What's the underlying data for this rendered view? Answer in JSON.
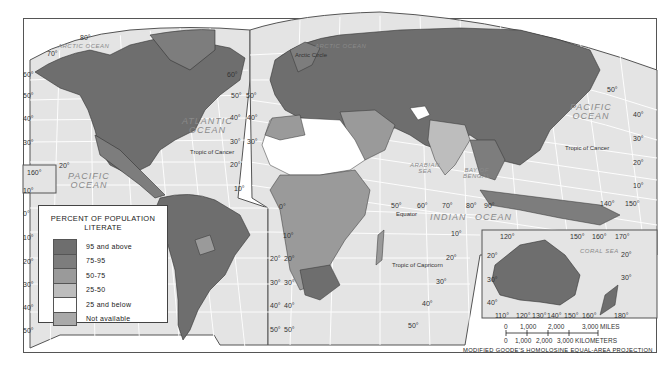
{
  "map": {
    "title": "Percent of Population Literate",
    "projection": "MODIFIED GOODE'S HOMOLOSINE EQUAL-AREA PROJECTION",
    "colors": {
      "ocean": "#e4e4e4",
      "grid": "#ffffff",
      "border": "#333333",
      "frame": "#555555"
    }
  },
  "legend": {
    "title_line1": "PERCENT OF POPULATION",
    "title_line2": "LITERATE",
    "items": [
      {
        "label": "95 and above",
        "color": "#6e6e6e"
      },
      {
        "label": "75-95",
        "color": "#7d7d7d"
      },
      {
        "label": "50-75",
        "color": "#9a9a9a"
      },
      {
        "label": "25-50",
        "color": "#bdbdbd"
      },
      {
        "label": "25 and below",
        "color": "#ffffff"
      },
      {
        "label": "Not available",
        "color": "#a9a9a9"
      }
    ]
  },
  "oceans": {
    "arctic_left": "ARCTIC OCEAN",
    "arctic_right": "ARCTIC OCEAN",
    "atlantic_1": "ATLANTIC",
    "atlantic_2": "OCEAN",
    "pacific_left_1": "PACIFIC",
    "pacific_left_2": "OCEAN",
    "pacific_right_1": "PACIFIC",
    "pacific_right_2": "OCEAN",
    "indian": "INDIAN",
    "indian_ocean": "OCEAN",
    "arabian_1": "ARABIAN",
    "arabian_2": "SEA",
    "bengal_1": "BAY OF",
    "bengal_2": "BENGAL",
    "coral": "CORAL SEA"
  },
  "lines": {
    "arctic_circle": "Arctic Circle",
    "tropic_cancer_atlantic": "Tropic of Cancer",
    "tropic_cancer_pacific": "Tropic of Cancer",
    "equator": "Equator",
    "tropic_capricorn": "Tropic of Capricorn"
  },
  "lat_labels": {
    "l80": "80°",
    "l70": "70°",
    "l60a": "60°",
    "l50a": "50°",
    "l40a": "40°",
    "l30a": "30°",
    "l20a": "20°",
    "l10a": "10°",
    "l0a": "0°",
    "l20b": "20°",
    "l30b": "30°",
    "l40b": "40°",
    "l50b": "50°",
    "l10b": "10°",
    "m60": "60°",
    "m50a": "50°",
    "m50b": "50°",
    "m40a": "40°",
    "m40b": "40°",
    "m30a": "30°",
    "m30b": "30°",
    "m20": "20°",
    "m10": "10°",
    "s0": "0°",
    "s10": "10°",
    "s20a": "20°",
    "s20b": "20°",
    "s30a": "30°",
    "s30b": "30°",
    "s40a": "40°",
    "s40b": "40°",
    "s50a": "50°",
    "s50b": "50°",
    "e50": "50°",
    "e60": "60°",
    "e70": "70°",
    "e80": "80°",
    "e90": "90°",
    "i10": "10°",
    "i20": "20°",
    "i30": "30°",
    "i40": "40°",
    "i50": "50°",
    "i20r": "20°",
    "p50": "50°",
    "p40": "40°",
    "p30": "30°",
    "p20": "20°",
    "p10": "10°",
    "p140": "140°",
    "p150": "150°",
    "h160": "160°",
    "h20": "20°",
    "a120": "120°",
    "a150": "150°",
    "a160": "160°",
    "a170": "170°",
    "a20": "20°",
    "a30": "30°",
    "a20l": "20°",
    "a30l": "30°",
    "a40l": "40°",
    "b110": "110°",
    "b120": "120°",
    "b130": "130°",
    "b140": "140°",
    "b150": "150°",
    "b160": "160°",
    "b180": "180°"
  },
  "scale": {
    "miles_ticks": [
      "0",
      "1,000",
      "2,000",
      "3,000 MILES"
    ],
    "km_ticks": [
      "0",
      "1,000",
      "2,000",
      "3,000 KILOMETERS"
    ]
  }
}
